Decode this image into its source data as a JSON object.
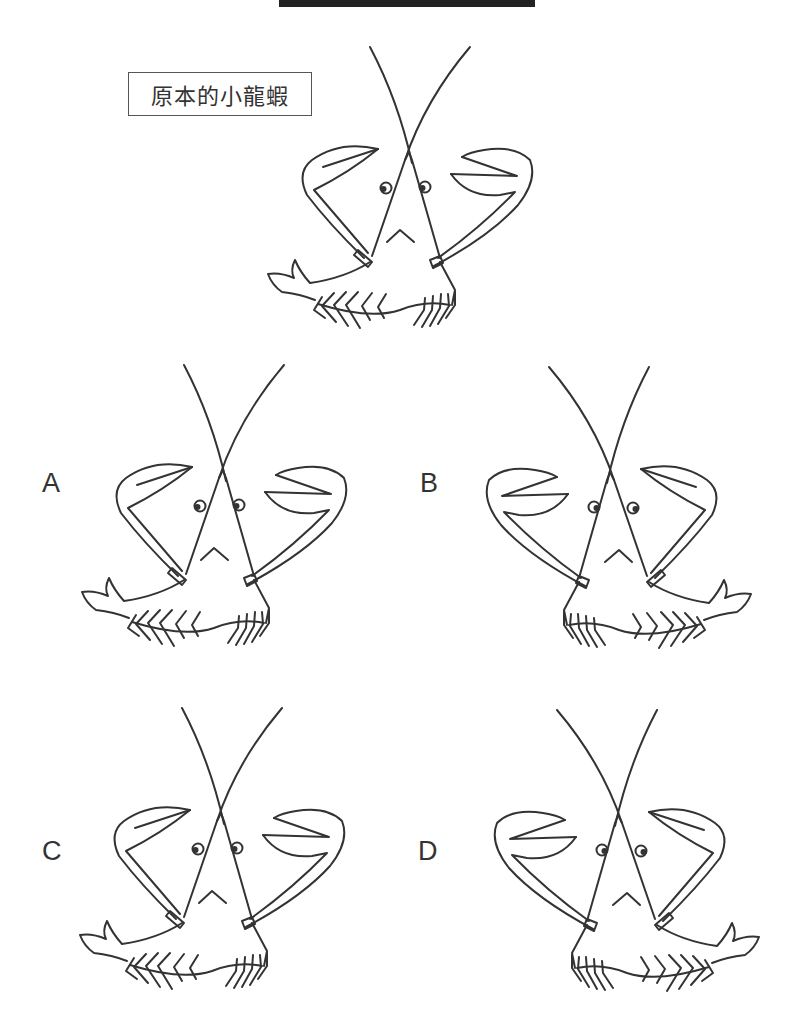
{
  "header": {
    "bar_color": "#222222"
  },
  "original": {
    "label": "原本的小龍蝦"
  },
  "options": [
    {
      "letter": "A",
      "transform": "none"
    },
    {
      "letter": "B",
      "transform": "mirrored"
    },
    {
      "letter": "C",
      "transform": "none"
    },
    {
      "letter": "D",
      "transform": "mirrored"
    }
  ],
  "colors": {
    "ink": "#333333",
    "background": "#ffffff"
  }
}
